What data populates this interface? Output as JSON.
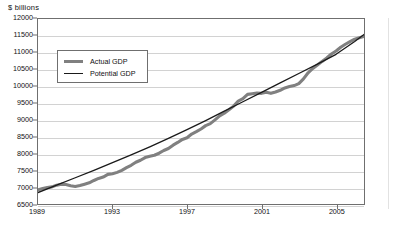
{
  "chart_data": {
    "type": "line",
    "title": "",
    "xlabel": "",
    "ylabel": "$ billions",
    "xlim": [
      1989,
      2006.5
    ],
    "ylim": [
      6500,
      12000
    ],
    "grid": true,
    "legend_position": "upper-left-inside",
    "ytick_labels": [
      "12000",
      "11500",
      "11000",
      "10500",
      "10000",
      "9500",
      "9000",
      "8500",
      "8000",
      "7500",
      "7000",
      "6500"
    ],
    "ytick_values": [
      12000,
      11500,
      11000,
      10500,
      10000,
      9500,
      9000,
      8500,
      8000,
      7500,
      7000,
      6500
    ],
    "xtick_labels": [
      "1989",
      "1993",
      "1997",
      "2001",
      "2005"
    ],
    "xtick_values": [
      1989,
      1993,
      1997,
      2001,
      2005
    ],
    "colors": {
      "actual": "#808080",
      "potential": "#1a1a1a",
      "grid": "#d2d2d2",
      "frame": "#6f6f6f"
    },
    "series": [
      {
        "name": "Actual GDP",
        "color": "#808080",
        "width": 3.1,
        "x": [
          1989.0,
          1989.25,
          1989.5,
          1989.75,
          1990.0,
          1990.25,
          1990.5,
          1990.75,
          1991.0,
          1991.25,
          1991.5,
          1991.75,
          1992.0,
          1992.25,
          1992.5,
          1992.75,
          1993.0,
          1993.25,
          1993.5,
          1993.75,
          1994.0,
          1994.25,
          1994.5,
          1994.75,
          1995.0,
          1995.25,
          1995.5,
          1995.75,
          1996.0,
          1996.25,
          1996.5,
          1996.75,
          1997.0,
          1997.25,
          1997.5,
          1997.75,
          1998.0,
          1998.25,
          1998.5,
          1998.75,
          1999.0,
          1999.25,
          1999.5,
          1999.75,
          2000.0,
          2000.25,
          2000.5,
          2000.75,
          2001.0,
          2001.25,
          2001.5,
          2001.75,
          2002.0,
          2002.25,
          2002.5,
          2002.75,
          2003.0,
          2003.25,
          2003.5,
          2003.75,
          2004.0,
          2004.25,
          2004.5,
          2004.75,
          2005.0,
          2005.25,
          2005.5,
          2005.75,
          2006.0,
          2006.25,
          2006.5
        ],
        "y": [
          6920,
          6960,
          6990,
          7010,
          7060,
          7090,
          7080,
          7040,
          7020,
          7050,
          7090,
          7130,
          7200,
          7260,
          7300,
          7380,
          7400,
          7440,
          7500,
          7580,
          7650,
          7740,
          7800,
          7880,
          7920,
          7950,
          8010,
          8090,
          8150,
          8250,
          8330,
          8420,
          8470,
          8580,
          8650,
          8730,
          8830,
          8890,
          9000,
          9120,
          9200,
          9300,
          9410,
          9560,
          9630,
          9760,
          9780,
          9800,
          9790,
          9820,
          9790,
          9830,
          9880,
          9950,
          9990,
          10020,
          10080,
          10220,
          10400,
          10530,
          10630,
          10740,
          10840,
          10960,
          11050,
          11160,
          11250,
          11330,
          11400,
          11440,
          11480
        ]
      },
      {
        "name": "Potential GDP",
        "color": "#1a1a1a",
        "width": 1.3,
        "x": [
          1989.0,
          1990.0,
          1991.0,
          1992.0,
          1993.0,
          1994.0,
          1995.0,
          1996.0,
          1997.0,
          1998.0,
          1999.0,
          2000.0,
          2001.0,
          2002.0,
          2003.0,
          2004.0,
          2005.0,
          2006.0,
          2006.5
        ],
        "y": [
          6840,
          7060,
          7280,
          7500,
          7730,
          7960,
          8200,
          8450,
          8710,
          8980,
          9260,
          9540,
          9820,
          10100,
          10380,
          10660,
          10950,
          11330,
          11540
        ]
      }
    ]
  },
  "legend": {
    "entries": [
      {
        "label": "Actual GDP"
      },
      {
        "label": "Potential GDP"
      }
    ]
  }
}
